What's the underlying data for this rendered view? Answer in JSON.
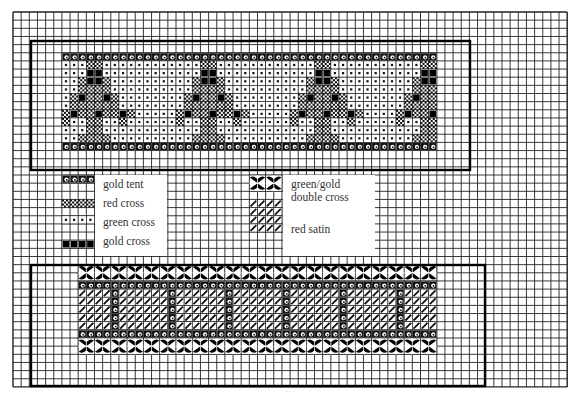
{
  "grid": {
    "origin_x": 13,
    "origin_y": 12,
    "cell": 8.15,
    "cols": 68,
    "rows": 46,
    "line_color": "#222222",
    "bold_every": 0
  },
  "frames": [
    {
      "name": "top-frame",
      "x": 31,
      "y": 41,
      "w": 439,
      "h": 129
    },
    {
      "name": "bottom-frame",
      "x": 31,
      "y": 265,
      "w": 454,
      "h": 121
    }
  ],
  "stitch_types": {
    "T": {
      "name": "gold tent"
    },
    "R": {
      "name": "red cross"
    },
    "G": {
      "name": "green cross"
    },
    "Y": {
      "name": "gold cross"
    },
    "D": {
      "name": "green/gold double cross"
    },
    "S": {
      "name": "red satin"
    }
  },
  "top_band": {
    "col": 6,
    "row": 5,
    "tree_motif": [
      "TTTTTTTTTT",
      "GGGRRGGGGG",
      "GGGYYGGGGG",
      "GGRYYRGGGG",
      "GGRRRRGGGG",
      "GRYRRYRGGG",
      "GRRRRRRGGG",
      "RYRRYRRYRG",
      "RGGRRGGRGG",
      "GGGRRGGGGG",
      "GGRRRRGGGG",
      "TTTTTTTTTT"
    ],
    "rows": [
      "TTTTTTTTTTTTTTTTTTTTTTTTTTTTTTTTTTTTTTTTTTTTTT",
      "GGGRRGGGGGGGGGGGGRRGGGGGGGGGGGGRRGGGGGGGGGGGRR",
      "GGGYYGGGGGGGGGGGGYYGGGGGGGGGGGGYYGGGGGGGGGGGYY",
      "GGRYYRGGGGGGGGGGRYYRGGGGGGGGGGRYYRGGGGGGGGGRYY",
      "GGRRRRGGGGGGGGGGRRRRGGGGGGGGGGRRRRGGGGGGGGGRRR",
      "GRYRRYRGGGGGGGGRYRRYRGGGGGGGGRYRRYRGGGGGGGRYRR",
      "GRRRRRRGGGGGGGGRRRRRRGGGGGGGGRRRRRRGGGGGGGRRRR",
      "RYRRYRRYRGGGGGRYRRYRRYRGGGGGRYRRYRRYRGGGGRYRRY",
      "RGGRRGGRGGGGGGRGGRRGGRGGGGGGRGGRRGGRGGGGGRGGRR",
      "GGGRRGGGGGGGGGGGGRRGGGGGGGGGGGGRRGGGGGGGGGGGRR",
      "GGRRRRGGGGGGGGGGRRRRGGGGGGGGGGRRRRGGGGGGGGGRRR",
      "TTTTTTTTTTTTTTTTTTTTTTTTTTTTTTTTTTTTTTTTTTTTTT"
    ]
  },
  "bottom_band": {
    "col": 8,
    "row": 31,
    "rows": [
      "DDDDDDDDDDDDDDDDDDDDDDDDDDDDDDDDDDDDDDDDDDDD",
      "DDDDDDDDDDDDDDDDDDDDDDDDDDDDDDDDDDDDDDDDDDDD",
      "TTTTTTTTTTTTTTTTTTTTTTTTTTTTTTTTTTTTTTTTTTTT",
      "SSSSTSSSSSSTSSSSSSTSSSSSSTSSSSSSTSSSSSSTSSSS",
      "SSSSTSSSSSSTSSSSSSTSSSSSSTSSSSSSTSSSSSSTSSSS",
      "SSSSTSSSSSSTSSSSSSTSSSSSSTSSSSSSTSSSSSSTSSSS",
      "SSSSTSSSSSSTSSSSSSTSSSSSSTSSSSSSTSSSSSSTSSSS",
      "SSSSTSSSSSSTSSSSSSTSSSSSSTSSSSSSTSSSSSSTSSSS",
      "TTTTTTTTTTTTTTTTTTTTTTTTTTTTTTTTTTTTTTTTTTTT",
      "DDDDDDDDDDDDDDDDDDDDDDDDDDDDDDDDDDDDDDDDDDDD",
      "DDDDDDDDDDDDDDDDDDDDDDDDDDDDDDDDDDDDDDDDDDDD"
    ]
  },
  "legend": {
    "left_box": {
      "x": 95,
      "y": 175,
      "w": 72,
      "h": 81
    },
    "right_box": {
      "x": 283,
      "y": 175,
      "w": 92,
      "h": 81
    },
    "items": [
      {
        "key": "T",
        "label": "gold tent",
        "swatch_col": 6,
        "swatch_row": 20,
        "swatch_w": 4,
        "swatch_h": 1,
        "label_x": 103,
        "label_y": 178
      },
      {
        "key": "R",
        "label": "red cross",
        "swatch_col": 6,
        "swatch_row": 23,
        "swatch_w": 4,
        "swatch_h": 1,
        "label_x": 103,
        "label_y": 197
      },
      {
        "key": "G",
        "label": "green cross",
        "swatch_col": 6,
        "swatch_row": 25,
        "swatch_w": 4,
        "swatch_h": 1,
        "label_x": 103,
        "label_y": 216
      },
      {
        "key": "Y",
        "label": "gold cross",
        "swatch_col": 6,
        "swatch_row": 28,
        "swatch_w": 4,
        "swatch_h": 1,
        "label_x": 103,
        "label_y": 235
      },
      {
        "key": "D",
        "label": "green/gold",
        "swatch_col": 29,
        "swatch_row": 20,
        "swatch_w": 4,
        "swatch_h": 2,
        "label_x": 291,
        "label_y": 178
      },
      {
        "key": "D2",
        "label": "double cross",
        "label_x": 291,
        "label_y": 191
      },
      {
        "key": "S",
        "label": "red satin",
        "swatch_col": 29,
        "swatch_row": 23,
        "swatch_w": 4,
        "swatch_h": 4,
        "label_x": 291,
        "label_y": 223
      }
    ]
  },
  "caption": "· · ·"
}
